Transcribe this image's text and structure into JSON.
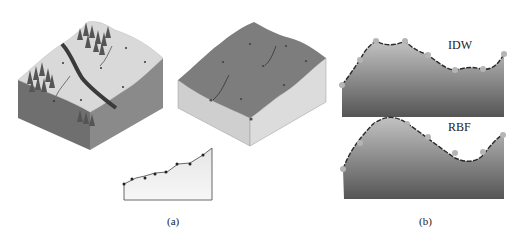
{
  "figure": {
    "panel_a": {
      "caption": "(a)",
      "terrain_block": "terrain-with-trees-river-and-sample-points",
      "interpolated_block": "interpolated-surface-with-sample-points",
      "profile_chart": "sampled-elevation-profile"
    },
    "panel_b": {
      "caption": "(b)",
      "top_profile": {
        "label": "IDW"
      },
      "bottom_profile": {
        "label": "RBF"
      }
    },
    "colors": {
      "surface_light": "#d9d9d9",
      "surface_dark": "#7d7d7d",
      "side_dark": "#6e6e6e",
      "side_light": "#cfcfcf",
      "curve": "#2a2a2a",
      "sample_point": "#b5b5b5",
      "river": "#3a3a3a",
      "tree": "#555555"
    }
  }
}
